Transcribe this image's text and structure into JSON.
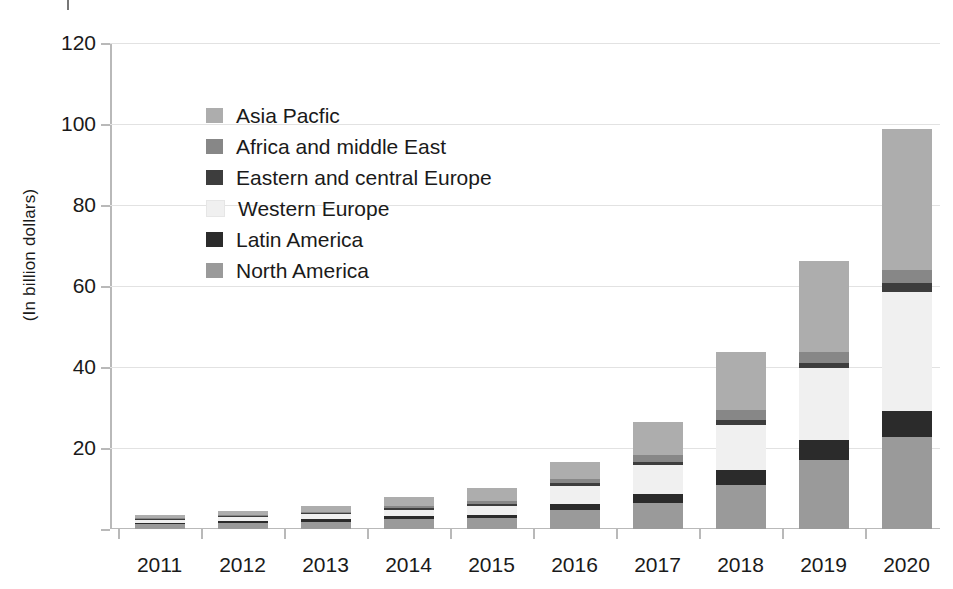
{
  "chart_data": {
    "type": "bar",
    "stacked": true,
    "title": "",
    "xlabel": "",
    "ylabel": "(In billion dollars)",
    "ylim": [
      0,
      120
    ],
    "yticks": [
      0,
      20,
      40,
      60,
      80,
      100,
      120
    ],
    "ytick_labels": [
      "",
      "20",
      "40",
      "60",
      "80",
      "100",
      "120"
    ],
    "grid": true,
    "legend_position": "inside-upper-left",
    "categories": [
      "2011",
      "2012",
      "2013",
      "2014",
      "2015",
      "2016",
      "2017",
      "2018",
      "2019",
      "2020"
    ],
    "series": [
      {
        "name": "North America",
        "color": "#9a9a9a",
        "values": [
          1.2,
          1.5,
          1.8,
          2.4,
          2.6,
          4.7,
          6.4,
          10.8,
          17.0,
          22.7
        ]
      },
      {
        "name": "Latin America",
        "color": "#2b2b2b",
        "values": [
          0.4,
          0.5,
          0.6,
          0.8,
          0.9,
          1.5,
          2.2,
          3.7,
          4.9,
          6.4
        ]
      },
      {
        "name": "Western Europe",
        "color": "#f0f0f0",
        "values": [
          0.7,
          0.9,
          1.2,
          1.6,
          2.1,
          4.4,
          7.2,
          11.1,
          17.8,
          29.4
        ]
      },
      {
        "name": "Eastern and central Europe",
        "color": "#3d3d3d",
        "values": [
          0.2,
          0.2,
          0.3,
          0.4,
          0.5,
          0.7,
          0.8,
          1.2,
          1.2,
          2.2
        ]
      },
      {
        "name": "Africa and middle East",
        "color": "#878787",
        "values": [
          0.2,
          0.3,
          0.4,
          0.5,
          0.7,
          1.0,
          1.7,
          2.5,
          2.7,
          3.2
        ]
      },
      {
        "name": "Asia Pacfic",
        "color": "#adadad",
        "values": [
          0.8,
          1.1,
          1.5,
          2.1,
          3.3,
          4.3,
          8.2,
          14.3,
          22.5,
          34.8
        ]
      }
    ],
    "legend_order": [
      "Asia Pacfic",
      "Africa and middle East",
      "Eastern and central Europe",
      "Western Europe",
      "Latin America",
      "North America"
    ],
    "totals": [
      3.5,
      4.5,
      5.8,
      7.8,
      10.1,
      16.6,
      26.5,
      43.6,
      66.1,
      98.7
    ]
  },
  "legend": {
    "items": [
      {
        "label": "Asia Pacfic",
        "color": "#adadad"
      },
      {
        "label": "Africa and middle East",
        "color": "#878787"
      },
      {
        "label": "Eastern and central Europe",
        "color": "#3d3d3d"
      },
      {
        "label": "Western Europe",
        "color": "#f0f0f0"
      },
      {
        "label": "Latin America",
        "color": "#2b2b2b"
      },
      {
        "label": "North America",
        "color": "#9a9a9a"
      }
    ]
  },
  "axes": {
    "y_title": "(In billion dollars)"
  }
}
